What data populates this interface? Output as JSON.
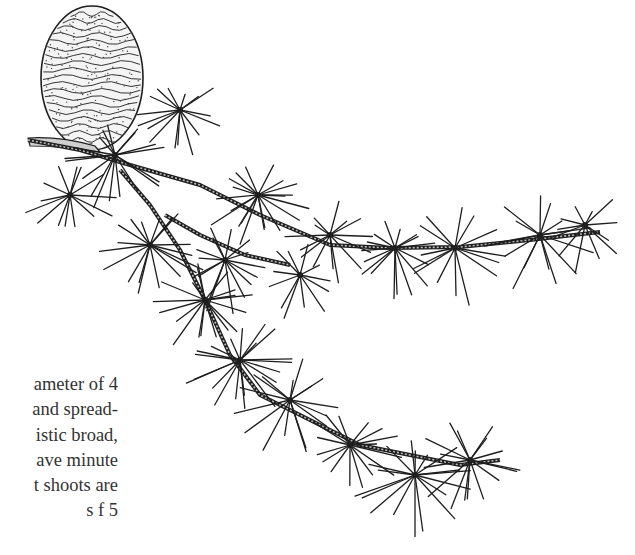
{
  "page": {
    "type": "book-page",
    "background": "#ffffff",
    "ink_color": "#1e1e1e"
  },
  "body_text": {
    "lines": [
      "ameter of 4",
      "and spread-",
      "istic broad,",
      "ave minute",
      "t shoots are",
      "s  f  5"
    ]
  },
  "illustration": {
    "subject": "cedar branch with cone and needle clusters",
    "cone": {
      "label": "seed cone"
    },
    "branches": [
      {
        "name": "main-branch",
        "points": [
          [
            28,
            140
          ],
          [
            80,
            150
          ],
          [
            130,
            165
          ],
          [
            200,
            185
          ],
          [
            260,
            215
          ],
          [
            330,
            245
          ],
          [
            390,
            248
          ],
          [
            460,
            247
          ],
          [
            530,
            240
          ],
          [
            600,
            232
          ]
        ]
      },
      {
        "name": "lower-branch",
        "points": [
          [
            120,
            170
          ],
          [
            150,
            205
          ],
          [
            180,
            250
          ],
          [
            205,
            300
          ],
          [
            230,
            355
          ],
          [
            260,
            395
          ],
          [
            310,
            420
          ],
          [
            360,
            445
          ],
          [
            410,
            455
          ],
          [
            460,
            465
          ],
          [
            500,
            460
          ]
        ]
      },
      {
        "name": "side-shoot",
        "points": [
          [
            165,
            215
          ],
          [
            200,
            235
          ],
          [
            245,
            255
          ],
          [
            290,
            265
          ]
        ]
      }
    ],
    "needle_clusters": [
      {
        "name": "cluster-1",
        "center": [
          115,
          155
        ],
        "count": 18,
        "len": 55
      },
      {
        "name": "cluster-2",
        "center": [
          180,
          110
        ],
        "count": 16,
        "len": 45
      },
      {
        "name": "cluster-3",
        "center": [
          258,
          195
        ],
        "count": 20,
        "len": 50
      },
      {
        "name": "cluster-4",
        "center": [
          330,
          235
        ],
        "count": 14,
        "len": 45
      },
      {
        "name": "cluster-5",
        "center": [
          395,
          248
        ],
        "count": 16,
        "len": 50
      },
      {
        "name": "cluster-6",
        "center": [
          455,
          248
        ],
        "count": 14,
        "len": 55
      },
      {
        "name": "cluster-7",
        "center": [
          540,
          235
        ],
        "count": 16,
        "len": 55
      },
      {
        "name": "cluster-8",
        "center": [
          585,
          225
        ],
        "count": 12,
        "len": 45
      },
      {
        "name": "cluster-9",
        "center": [
          70,
          195
        ],
        "count": 14,
        "len": 45
      },
      {
        "name": "cluster-10",
        "center": [
          150,
          245
        ],
        "count": 18,
        "len": 55
      },
      {
        "name": "cluster-11",
        "center": [
          225,
          260
        ],
        "count": 16,
        "len": 50
      },
      {
        "name": "cluster-12",
        "center": [
          205,
          300
        ],
        "count": 18,
        "len": 50
      },
      {
        "name": "cluster-13",
        "center": [
          240,
          360
        ],
        "count": 20,
        "len": 55
      },
      {
        "name": "cluster-14",
        "center": [
          290,
          400
        ],
        "count": 16,
        "len": 55
      },
      {
        "name": "cluster-15",
        "center": [
          350,
          445
        ],
        "count": 16,
        "len": 50
      },
      {
        "name": "cluster-16",
        "center": [
          415,
          475
        ],
        "count": 18,
        "len": 60
      },
      {
        "name": "cluster-17",
        "center": [
          470,
          460
        ],
        "count": 16,
        "len": 55
      },
      {
        "name": "cluster-18",
        "center": [
          300,
          275
        ],
        "count": 12,
        "len": 45
      }
    ]
  }
}
